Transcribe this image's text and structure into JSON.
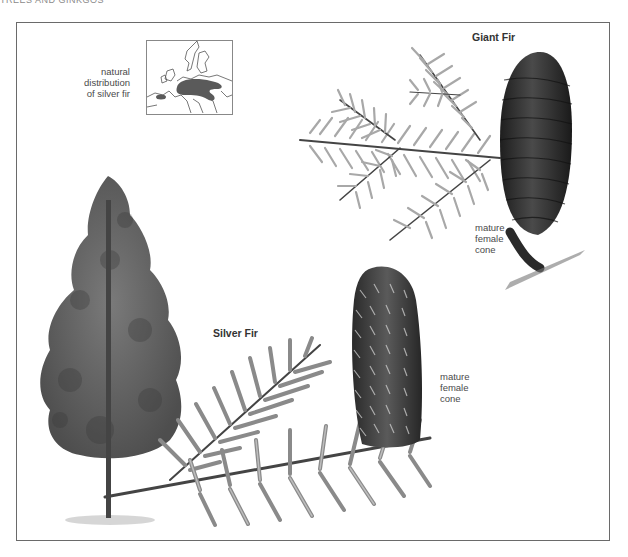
{
  "header": {
    "section_title": "TREES AND GINKGOS"
  },
  "map": {
    "caption_lines": [
      "natural",
      "distribution",
      "of silver fir"
    ],
    "region": "Europe",
    "highlight_color": "#5a5a5a"
  },
  "giant_fir": {
    "title": "Giant Fir",
    "cone_label_lines": [
      "mature",
      "female",
      "cone"
    ],
    "cone_color": "#2e2e2e",
    "needle_color": "#9a9a9a"
  },
  "silver_fir": {
    "title": "Silver Fir",
    "cone_label_lines": [
      "mature",
      "female",
      "cone"
    ],
    "cone_color": "#3c3c3c",
    "needle_color": "#8a8a8a",
    "tree_color": "#5f5f5f"
  }
}
